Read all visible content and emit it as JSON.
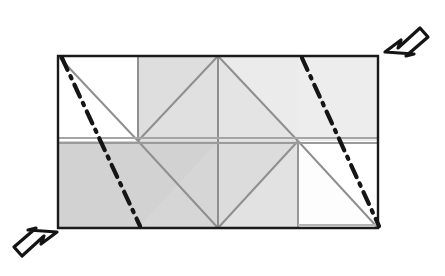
{
  "figure": {
    "type": "geometric-diagram",
    "canvas": {
      "width": 445,
      "height": 276,
      "background": "#ffffff"
    },
    "colors": {
      "outline": "#1a1a1a",
      "inner_line": "#9a9a9a",
      "fill_white": "#ffffff",
      "fill_light_gray": "#ebebeb",
      "fill_mid_gray": "#dcdcdc",
      "fill_dark_gray": "#cfcfcf",
      "fold_line": "#151515",
      "arrow_outline": "#141414",
      "arrow_fill": "#ffffff"
    },
    "frame": {
      "left": 58,
      "top": 56,
      "right": 378,
      "bottom": 228,
      "mid_y": 141,
      "center_x": 218,
      "quarter_x": 138,
      "three_quarter_x": 298,
      "outline_width": 2.2
    },
    "cells": [
      {
        "name": "top-left-square",
        "fill": "#ffffff",
        "x": 58,
        "y": 56,
        "w": 80,
        "h": 85,
        "diagonal": "tl-br"
      },
      {
        "name": "top-second-cell",
        "fill": "#e3e3e3",
        "x": 138,
        "y": 56,
        "w": 80,
        "h": 85,
        "diagonal": "bl-tr"
      },
      {
        "name": "top-third-triangle",
        "fill": "#ebebeb",
        "x": 218,
        "y": 56,
        "w": 80,
        "h": 85,
        "diagonal": "tl-br"
      },
      {
        "name": "top-right-rect",
        "fill": "#ededed",
        "x": 298,
        "y": 56,
        "w": 80,
        "h": 85,
        "diagonal": "none"
      },
      {
        "name": "bottom-left-rect",
        "fill": "#d3d3d3",
        "x": 58,
        "y": 141,
        "w": 80,
        "h": 87,
        "diagonal": "none"
      },
      {
        "name": "bottom-second-cell",
        "fill": "#d8d8d8",
        "x": 138,
        "y": 141,
        "w": 80,
        "h": 87,
        "diagonal": "tl-br"
      },
      {
        "name": "bottom-third-cell",
        "fill": "#e2e2e2",
        "x": 218,
        "y": 141,
        "w": 80,
        "h": 87,
        "diagonal": "bl-tr"
      },
      {
        "name": "bottom-right-square",
        "fill": "#ffffff",
        "x": 298,
        "y": 141,
        "w": 80,
        "h": 87,
        "diagonal": "tl-br"
      }
    ],
    "fold_lines": [
      {
        "name": "left-fold-line",
        "x1": 62,
        "y1": 58,
        "x2": 140,
        "y2": 226,
        "style": "dash-dot",
        "width": 4
      },
      {
        "name": "right-fold-line",
        "x1": 302,
        "y1": 58,
        "x2": 378,
        "y2": 226,
        "style": "dash-dot",
        "width": 4
      }
    ],
    "arrows": [
      {
        "name": "top-right-arrow",
        "direction": "down-left",
        "tip_x": 385,
        "tip_y": 52
      },
      {
        "name": "bottom-left-arrow",
        "direction": "up-right",
        "tip_x": 58,
        "tip_y": 231
      }
    ]
  }
}
